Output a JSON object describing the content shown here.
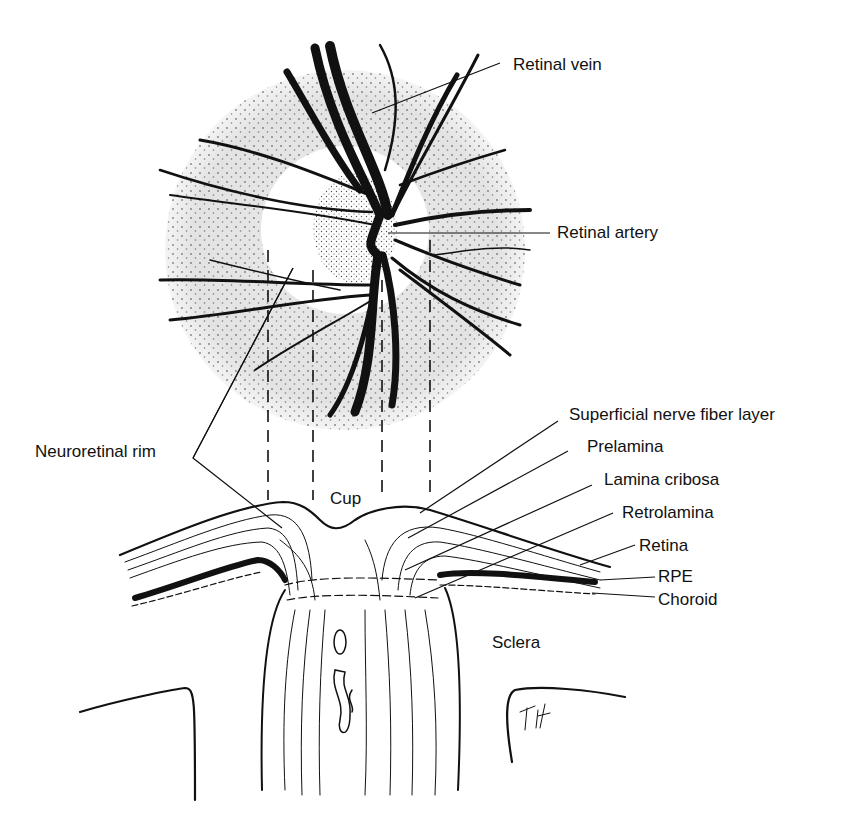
{
  "figure": {
    "type": "anatomical-illustration",
    "colors": {
      "ink": "#111111",
      "disc_shading": "#e6e6e6",
      "background": "#ffffff"
    }
  },
  "labels": {
    "retinal_vein": "Retinal vein",
    "retinal_artery": "Retinal artery",
    "neuroretinal_rim": "Neuroretinal rim",
    "cup": "Cup",
    "superficial_nerve_fiber_layer": "Superficial nerve fiber layer",
    "prelamina": "Prelamina",
    "lamina_cribosa": "Lamina cribosa",
    "retrolamina": "Retrolamina",
    "retina": "Retina",
    "rpe": "RPE",
    "choroid": "Choroid",
    "sclera": "Sclera"
  },
  "signature": "T.H."
}
